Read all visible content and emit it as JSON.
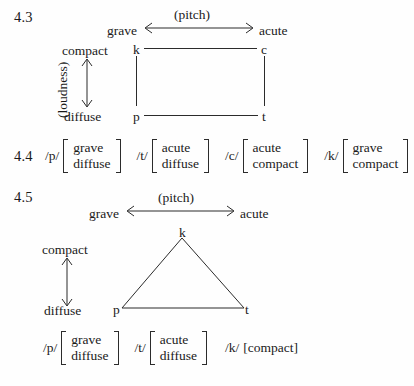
{
  "examples": [
    {
      "number": "4.3",
      "pitch_axis": {
        "caption": "(pitch)",
        "left_label": "grave",
        "right_label": "acute"
      },
      "loudness_axis": {
        "caption": "(loudness)",
        "top_label": "compact",
        "bottom_label": "diffuse"
      },
      "diagram": {
        "shape": "square",
        "nodes": {
          "top_left": "k",
          "top_right": "c",
          "bottom_left": "p",
          "bottom_right": "t"
        }
      }
    },
    {
      "number": "4.4",
      "matrices": [
        {
          "phoneme": "/p/",
          "features": [
            "grave",
            "diffuse"
          ]
        },
        {
          "phoneme": "/t/",
          "features": [
            "acute",
            "diffuse"
          ]
        },
        {
          "phoneme": "/c/",
          "features": [
            "acute",
            "compact"
          ]
        },
        {
          "phoneme": "/k/",
          "features": [
            "grave",
            "compact"
          ]
        }
      ]
    },
    {
      "number": "4.5",
      "pitch_axis": {
        "caption": "(pitch)",
        "left_label": "grave",
        "right_label": "acute"
      },
      "loudness_axis": {
        "top_label": "compact",
        "bottom_label": "diffuse"
      },
      "diagram": {
        "shape": "triangle",
        "nodes": {
          "apex": "k",
          "bottom_left": "p",
          "bottom_right": "t"
        }
      },
      "matrices": [
        {
          "phoneme": "/p/",
          "features": [
            "grave",
            "diffuse"
          ]
        },
        {
          "phoneme": "/t/",
          "features": [
            "acute",
            "diffuse"
          ]
        },
        {
          "phoneme": "/k/",
          "features": [
            "compact"
          ],
          "inline": "[compact]"
        }
      ]
    }
  ],
  "colors": {
    "ink": "#1a1a1a",
    "line": "#2b2b2b",
    "paper": "#fefefe"
  }
}
